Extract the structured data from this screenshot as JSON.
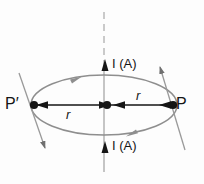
{
  "figure": {
    "background_color": "#fdfdfd",
    "ink_color": "#151515",
    "loop_color": "#8e8e8e",
    "axis_color": "#9a9a9a",
    "labels": {
      "point_right": "P",
      "point_left": "P′",
      "current_top": "I (A)",
      "current_bottom": "I (A)",
      "radius_right": "r",
      "radius_left": "r"
    },
    "geometry": {
      "loop_center_x": 104,
      "loop_center_y": 105,
      "loop_radius_x": 73,
      "loop_radius_y": 30,
      "point_right_x": 174,
      "point_left_x": 33,
      "center_dot_x": 107,
      "axis_x": 104
    },
    "icons": {
      "current_arrow_up": "arrow-up-icon",
      "loop_direction_top": "arrow-right-icon",
      "loop_direction_bottom": "arrow-right-icon",
      "field_arrow_right": "arrow-up-right-icon",
      "field_arrow_left": "arrow-down-left-icon"
    }
  }
}
